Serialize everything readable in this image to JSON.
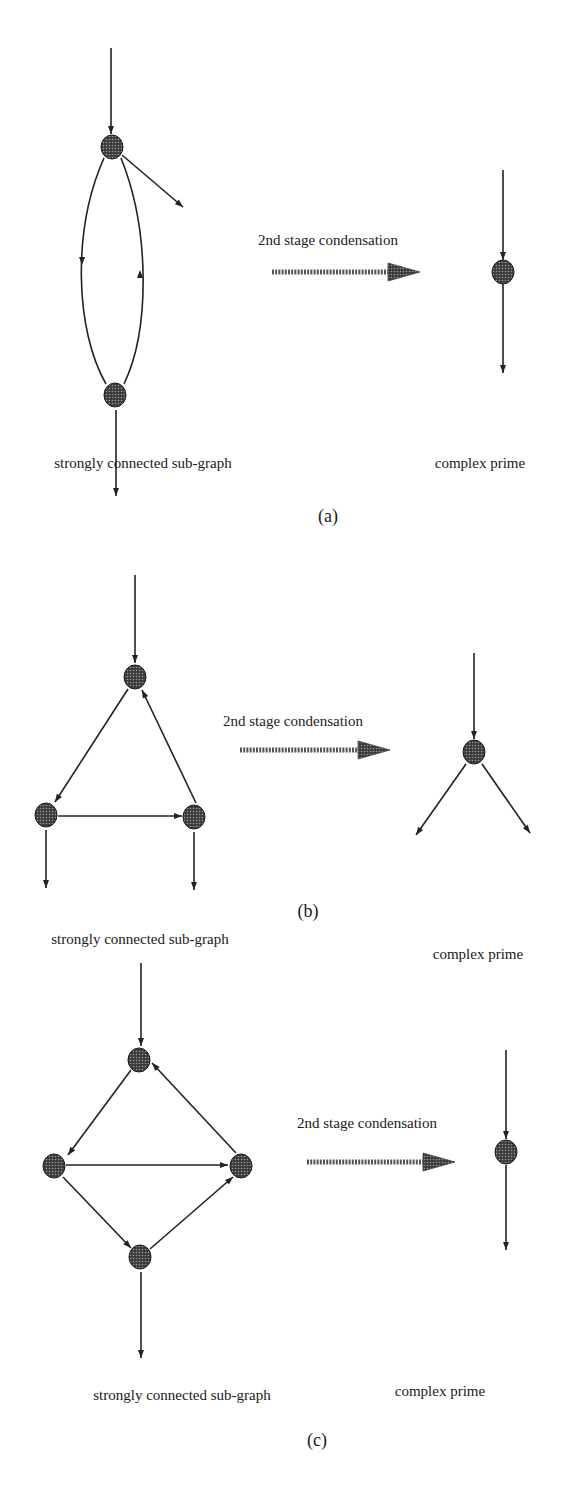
{
  "colors": {
    "ink": "#222222",
    "node_fill": "#4a4a4a",
    "node_dot": "#9a9a9a",
    "arrow_fill": "#555555",
    "background": "#ffffff"
  },
  "panels": [
    {
      "id": "a",
      "caption": "(a)",
      "caption_pos": [
        328,
        522
      ],
      "left_label": "strongly connected sub-graph",
      "left_label_pos": [
        143,
        468
      ],
      "right_label": "complex prime",
      "right_label_pos": [
        480,
        468
      ],
      "transform_label": "2nd stage condensation",
      "transform_label_pos": [
        328,
        245
      ],
      "transform_arrow": [
        272,
        272,
        420
      ],
      "left_nodes": [
        [
          112,
          147
        ],
        [
          115,
          395
        ]
      ],
      "left_edges": [
        {
          "type": "line",
          "from": [
            111,
            48
          ],
          "to": [
            111,
            134
          ]
        },
        {
          "type": "line",
          "from": [
            122,
            155
          ],
          "to": [
            183,
            207
          ]
        },
        {
          "type": "path",
          "d": "M104 158 C 72 230, 75 330, 106 384"
        },
        {
          "type": "path",
          "d": "M124 384 C 150 330, 150 230, 121 158"
        },
        {
          "type": "line",
          "from": [
            116,
            410
          ],
          "to": [
            116,
            496
          ]
        }
      ],
      "left_arrowheads": [
        [
          111,
          134,
          90
        ],
        [
          183,
          207,
          40
        ],
        [
          82,
          265,
          90
        ],
        [
          140,
          270,
          -90
        ],
        [
          116,
          496,
          90
        ]
      ],
      "right_nodes": [
        [
          503,
          272
        ]
      ],
      "right_edges": [
        {
          "type": "line",
          "from": [
            503,
            170
          ],
          "to": [
            503,
            260
          ]
        },
        {
          "type": "line",
          "from": [
            503,
            284
          ],
          "to": [
            503,
            373
          ]
        }
      ],
      "right_arrowheads": [
        [
          503,
          260,
          90
        ],
        [
          503,
          373,
          90
        ]
      ]
    },
    {
      "id": "b",
      "caption": "(b)",
      "caption_pos": [
        308,
        917
      ],
      "left_label": "strongly connected sub-graph",
      "left_label_pos": [
        140,
        944
      ],
      "right_label": "complex prime",
      "right_label_pos": [
        478,
        959
      ],
      "transform_label": "2nd stage condensation",
      "transform_label_pos": [
        293,
        726
      ],
      "transform_arrow": [
        240,
        750,
        390
      ],
      "left_nodes": [
        [
          135,
          677
        ],
        [
          46,
          815
        ],
        [
          194,
          817
        ]
      ],
      "left_edges": [
        {
          "type": "line",
          "from": [
            135,
            575
          ],
          "to": [
            135,
            663
          ]
        },
        {
          "type": "line",
          "from": [
            128,
            689
          ],
          "to": [
            55,
            802
          ]
        },
        {
          "type": "line",
          "from": [
            196,
            803
          ],
          "to": [
            142,
            690
          ]
        },
        {
          "type": "line",
          "from": [
            58,
            816
          ],
          "to": [
            182,
            816
          ]
        },
        {
          "type": "line",
          "from": [
            46,
            830
          ],
          "to": [
            46,
            888
          ]
        },
        {
          "type": "line",
          "from": [
            194,
            832
          ],
          "to": [
            194,
            890
          ]
        }
      ],
      "left_arrowheads": [
        [
          135,
          663,
          90
        ],
        [
          55,
          802,
          123
        ],
        [
          142,
          690,
          -116
        ],
        [
          182,
          816,
          0
        ],
        [
          46,
          888,
          90
        ],
        [
          194,
          890,
          90
        ]
      ],
      "right_nodes": [
        [
          474,
          752
        ]
      ],
      "right_edges": [
        {
          "type": "line",
          "from": [
            474,
            653
          ],
          "to": [
            474,
            739
          ]
        },
        {
          "type": "line",
          "from": [
            466,
            764
          ],
          "to": [
            416,
            835
          ]
        },
        {
          "type": "line",
          "from": [
            482,
            764
          ],
          "to": [
            530,
            833
          ]
        }
      ],
      "right_arrowheads": [
        [
          474,
          739,
          90
        ],
        [
          416,
          835,
          125
        ],
        [
          530,
          833,
          55
        ]
      ]
    },
    {
      "id": "c",
      "caption": "(c)",
      "caption_pos": [
        317,
        1446
      ],
      "left_label": "strongly connected sub-graph",
      "left_label_pos": [
        182,
        1400
      ],
      "right_label": "complex prime",
      "right_label_pos": [
        440,
        1396
      ],
      "transform_label": "2nd stage condensation",
      "transform_label_pos": [
        367,
        1128
      ],
      "transform_arrow": [
        307,
        1162,
        455
      ],
      "left_nodes": [
        [
          139,
          1060
        ],
        [
          54,
          1166
        ],
        [
          241,
          1166
        ],
        [
          140,
          1257
        ]
      ],
      "left_edges": [
        {
          "type": "line",
          "from": [
            141,
            963
          ],
          "to": [
            141,
            1046
          ]
        },
        {
          "type": "line",
          "from": [
            131,
            1070
          ],
          "to": [
            68,
            1155
          ]
        },
        {
          "type": "line",
          "from": [
            236,
            1153
          ],
          "to": [
            152,
            1063
          ]
        },
        {
          "type": "line",
          "from": [
            66,
            1165
          ],
          "to": [
            228,
            1165
          ]
        },
        {
          "type": "line",
          "from": [
            63,
            1177
          ],
          "to": [
            131,
            1248
          ]
        },
        {
          "type": "line",
          "from": [
            150,
            1249
          ],
          "to": [
            233,
            1177
          ]
        },
        {
          "type": "line",
          "from": [
            141,
            1272
          ],
          "to": [
            141,
            1358
          ]
        }
      ],
      "left_arrowheads": [
        [
          141,
          1046,
          90
        ],
        [
          68,
          1155,
          127
        ],
        [
          152,
          1063,
          -133
        ],
        [
          228,
          1165,
          0
        ],
        [
          131,
          1248,
          46
        ],
        [
          233,
          1177,
          -41
        ],
        [
          141,
          1358,
          90
        ]
      ],
      "right_nodes": [
        [
          506,
          1152
        ]
      ],
      "right_edges": [
        {
          "type": "line",
          "from": [
            506,
            1050
          ],
          "to": [
            506,
            1139
          ]
        },
        {
          "type": "line",
          "from": [
            506,
            1165
          ],
          "to": [
            506,
            1250
          ]
        }
      ],
      "right_arrowheads": [
        [
          506,
          1139,
          90
        ],
        [
          506,
          1250,
          90
        ]
      ]
    }
  ]
}
